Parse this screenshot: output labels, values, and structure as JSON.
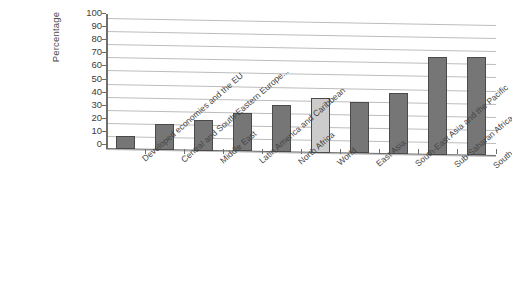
{
  "chart_data": {
    "type": "bar",
    "title": "",
    "subtitle": "",
    "xlabel": "",
    "ylabel": "Percentage",
    "ylim": [
      0,
      100
    ],
    "ytick_labels": [
      "100",
      "90",
      "80",
      "70",
      "60",
      "50",
      "40",
      "30",
      "20",
      "10",
      "0"
    ],
    "ytick_values": [
      100,
      90,
      80,
      70,
      60,
      50,
      40,
      30,
      20,
      10,
      0
    ],
    "grid": true,
    "legend": "none",
    "categories": [
      "Developed economies and the EU",
      "Central and South-Eastern Europe...",
      "Middle East",
      "Latin America and Caribbean",
      "North Africa",
      "World",
      "East Asia",
      "South-East Asia and the Pacific",
      "Sub-Saharan Africa",
      "South Asia"
    ],
    "values": [
      10,
      20,
      23,
      29,
      36,
      42,
      39,
      47,
      75,
      75
    ],
    "highlight_index": 5,
    "colors": {
      "bar": "#767676",
      "bar_highlight": "#cccccc",
      "bar_border": "#4a4a4a",
      "gridline": "#bcbcbc",
      "axis": "#6d6d6d",
      "text": "#454545",
      "background": "#ffffff"
    }
  }
}
